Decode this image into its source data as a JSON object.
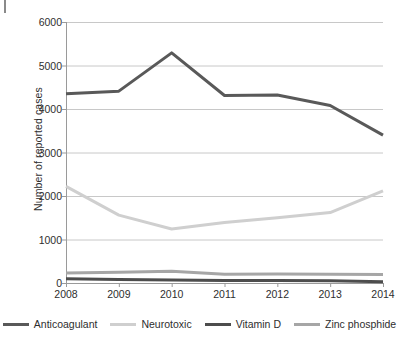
{
  "figure": {
    "artifact_mark": "page-edge-mark"
  },
  "chart_data": {
    "type": "line",
    "title": "",
    "xlabel": "",
    "ylabel": "Number of reported cases",
    "categories": [
      "2008",
      "2009",
      "2010",
      "2011",
      "2012",
      "2013",
      "2014"
    ],
    "x": [
      2008,
      2009,
      2010,
      2011,
      2012,
      2013,
      2014
    ],
    "ylim": [
      0,
      6000
    ],
    "yticks": [
      0,
      1000,
      2000,
      3000,
      4000,
      5000,
      6000
    ],
    "ytick_labels": [
      "0",
      "1000",
      "2000",
      "3000",
      "4000",
      "5000",
      "6000"
    ],
    "grid": "horizontal",
    "legend_position": "bottom",
    "series": [
      {
        "name": "Anticoagulant",
        "color": "#595959",
        "width": 3,
        "values": [
          4350,
          4410,
          5290,
          4310,
          4320,
          4080,
          3400
        ]
      },
      {
        "name": "Neurotoxic",
        "color": "#cfcfcf",
        "width": 3,
        "values": [
          2220,
          1560,
          1240,
          1390,
          1500,
          1620,
          2120
        ]
      },
      {
        "name": "Vitamin D",
        "color": "#4d4d4d",
        "width": 3,
        "values": [
          100,
          80,
          70,
          60,
          60,
          50,
          30
        ]
      },
      {
        "name": "Zinc phosphide",
        "color": "#a6a6a6",
        "width": 3,
        "values": [
          230,
          250,
          270,
          200,
          205,
          200,
          195
        ]
      }
    ]
  }
}
